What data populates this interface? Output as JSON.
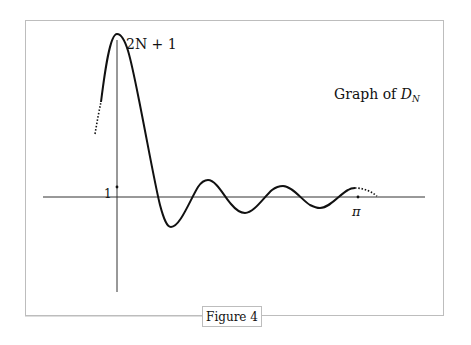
{
  "figure": {
    "caption": "Figure 4",
    "title_prefix": "Graph of ",
    "title_symbol": "D",
    "title_subscript": "N",
    "peak_label": "2N + 1",
    "y_tick_label": "1",
    "x_tick_label": "π"
  },
  "colors": {
    "frame": "#bdbdbd",
    "axis": "#333333",
    "curve": "#111111",
    "background": "#ffffff"
  }
}
